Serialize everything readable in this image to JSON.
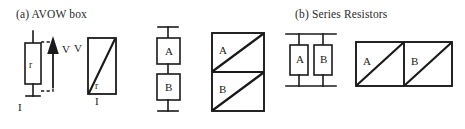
{
  "figure": {
    "background_color": "#ffffff",
    "ink_color": "#1a1a1a",
    "panels": [
      {
        "id": "a",
        "caption": "(a) AVOW box",
        "circuit": {
          "component_label": "r",
          "voltage_arrow_label": "V",
          "current_label": "I"
        },
        "avow_box": {
          "vertical_axis_label": "V",
          "horizontal_axis_label": "I",
          "diagonal_label": "r"
        }
      },
      {
        "id": "b",
        "caption": "(b) Series Resistors",
        "circuit": {
          "resistor_top_label": "A",
          "resistor_bottom_label": "B"
        },
        "avow_box": {
          "cell_top_label": "A",
          "cell_bottom_label": "B"
        }
      },
      {
        "id": "c",
        "caption": "(c) Parallel Resistors",
        "circuit": {
          "resistor_left_label": "A",
          "resistor_right_label": "B"
        },
        "avow_box": {
          "cell_left_label": "A",
          "cell_right_label": "B"
        }
      }
    ]
  }
}
